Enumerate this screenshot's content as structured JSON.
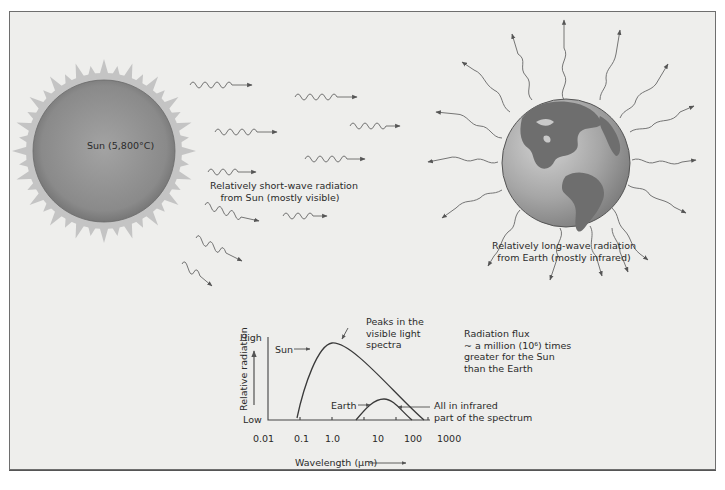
{
  "diagram": {
    "sun": {
      "label": "Sun (5,800°C)",
      "caption_line1": "Relatively short-wave radiation",
      "caption_line2": "from Sun (mostly visible)"
    },
    "earth": {
      "caption_line1": "Relatively long-wave radiation",
      "caption_line2": "from Earth (mostly infrared)"
    },
    "flux_note": {
      "line1": "Radiation flux",
      "line2": "~ a million (10⁶) times",
      "line3": "greater for the Sun",
      "line4": "than the Earth"
    },
    "colors": {
      "background": "#eeeeec",
      "sun_body": "#8e8e8e",
      "corona": "#c4c4c4",
      "ocean": "#a8a8a8",
      "land": "#6e6e6e",
      "line": "#555555"
    }
  },
  "chart_data": {
    "type": "line",
    "title": "",
    "xlabel": "Wavelength (µm)",
    "ylabel": "Relative radiation",
    "y_axis_ends": {
      "top": "High",
      "bottom": "Low"
    },
    "x_scale": "log",
    "x_ticks": [
      "0.01",
      "0.1",
      "1.0",
      "10",
      "100",
      "1000"
    ],
    "xlim": [
      0.01,
      1000
    ],
    "series": [
      {
        "name": "Sun",
        "x": [
          0.07,
          0.3,
          0.9,
          5,
          30,
          200
        ],
        "y": [
          0.0,
          0.75,
          1.0,
          0.7,
          0.3,
          0.0
        ],
        "peak_um": 0.9
      },
      {
        "name": "Earth",
        "x": [
          3,
          7,
          15,
          40,
          100
        ],
        "y": [
          0.0,
          0.3,
          0.42,
          0.25,
          0.0
        ],
        "peak_um": 15
      }
    ],
    "annotations": [
      {
        "text_line1": "Peaks in the",
        "text_line2": "visible light",
        "text_line3": "spectra",
        "target": "Sun peak"
      },
      {
        "text_line1": "All in infrared",
        "text_line2": "part of the spectrum",
        "target": "Earth curve"
      },
      {
        "text": "Sun",
        "target": "Sun curve"
      },
      {
        "text": "Earth",
        "target": "Earth curve"
      }
    ],
    "grid": false,
    "legend": "none"
  }
}
